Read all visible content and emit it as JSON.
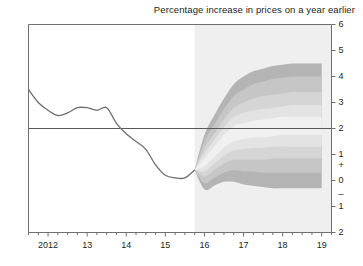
{
  "chart": {
    "title": "Percentage increase in prices on a year earlier"
  },
  "axes": {
    "y_ticks": [
      "6",
      "5",
      "4",
      "3",
      "2",
      "1",
      "0",
      "1",
      "2"
    ],
    "y_sign_positive": "+",
    "y_sign_negative": "–",
    "x_ticks": [
      "2012",
      "13",
      "14",
      "15",
      "16",
      "17",
      "18",
      "19"
    ]
  },
  "colors": {
    "axis": "#6f6f6f",
    "line": "#6e6f71",
    "target_line": "#58595b",
    "forecast_bg": "#efefef",
    "band_1": "#f0f0f0",
    "band_2": "#e3e3e3",
    "band_3": "#d5d5d5",
    "band_4": "#c6c6c6",
    "band_5": "#b4b4b4",
    "text": "#231f20"
  },
  "chart_data": {
    "type": "area",
    "title": "Percentage increase in prices on a year earlier",
    "xlabel": "",
    "ylabel": "Percentage increase in prices on a year earlier",
    "ylim": [
      -2,
      6
    ],
    "xlim": [
      2011.5,
      2019.25
    ],
    "grid": false,
    "legend": "none",
    "target_line_value": 2,
    "forecast_start_x": 2015.75,
    "history": {
      "name": "CPI inflation (actual)",
      "x": [
        2011.5,
        2011.75,
        2012.0,
        2012.25,
        2012.5,
        2012.75,
        2013.0,
        2013.25,
        2013.5,
        2013.75,
        2014.0,
        2014.25,
        2014.5,
        2014.75,
        2015.0,
        2015.25,
        2015.5,
        2015.75
      ],
      "values": [
        3.5,
        3.0,
        2.7,
        2.5,
        2.6,
        2.8,
        2.8,
        2.7,
        2.8,
        2.2,
        1.8,
        1.5,
        1.2,
        0.6,
        0.2,
        0.1,
        0.1,
        0.4
      ]
    },
    "forecast_bands": {
      "x": [
        2015.75,
        2016.0,
        2016.25,
        2016.5,
        2016.75,
        2017.0,
        2017.25,
        2017.5,
        2017.75,
        2018.0,
        2018.25,
        2018.5,
        2018.75,
        2019.0
      ],
      "central": [
        0.4,
        0.7,
        1.1,
        1.5,
        1.8,
        1.9,
        2.0,
        2.0,
        2.05,
        2.1,
        2.1,
        2.1,
        2.1,
        2.1
      ],
      "bands": [
        {
          "name": "30% interval",
          "lower": [
            0.4,
            0.55,
            0.9,
            1.25,
            1.5,
            1.6,
            1.65,
            1.65,
            1.7,
            1.75,
            1.75,
            1.75,
            1.75,
            1.75
          ],
          "upper": [
            0.4,
            0.85,
            1.3,
            1.75,
            2.1,
            2.2,
            2.3,
            2.35,
            2.4,
            2.45,
            2.45,
            2.45,
            2.45,
            2.45
          ]
        },
        {
          "name": "60% interval",
          "lower": [
            0.4,
            0.35,
            0.65,
            0.95,
            1.15,
            1.2,
            1.25,
            1.25,
            1.3,
            1.3,
            1.3,
            1.3,
            1.3,
            1.3
          ],
          "upper": [
            0.4,
            1.05,
            1.55,
            2.05,
            2.45,
            2.6,
            2.7,
            2.75,
            2.8,
            2.85,
            2.9,
            2.9,
            2.9,
            2.9
          ]
        },
        {
          "name": "75% interval",
          "lower": [
            0.4,
            0.15,
            0.4,
            0.65,
            0.8,
            0.8,
            0.8,
            0.8,
            0.85,
            0.85,
            0.85,
            0.85,
            0.85,
            0.85
          ],
          "upper": [
            0.4,
            1.25,
            1.8,
            2.35,
            2.8,
            3.0,
            3.15,
            3.25,
            3.3,
            3.35,
            3.4,
            3.4,
            3.4,
            3.4
          ]
        },
        {
          "name": "90% interval",
          "lower": [
            0.4,
            -0.1,
            0.1,
            0.3,
            0.4,
            0.35,
            0.35,
            0.3,
            0.3,
            0.3,
            0.3,
            0.3,
            0.3,
            0.3
          ],
          "upper": [
            0.4,
            1.5,
            2.15,
            2.75,
            3.25,
            3.5,
            3.7,
            3.8,
            3.9,
            3.95,
            4.0,
            4.0,
            4.0,
            4.0
          ]
        },
        {
          "name": "95% interval",
          "lower": [
            0.4,
            -0.35,
            -0.2,
            -0.05,
            -0.05,
            -0.15,
            -0.2,
            -0.25,
            -0.3,
            -0.3,
            -0.3,
            -0.3,
            -0.3,
            -0.3
          ],
          "upper": [
            0.4,
            1.75,
            2.5,
            3.15,
            3.7,
            4.0,
            4.2,
            4.3,
            4.4,
            4.45,
            4.5,
            4.5,
            4.5,
            4.5
          ]
        }
      ]
    }
  }
}
